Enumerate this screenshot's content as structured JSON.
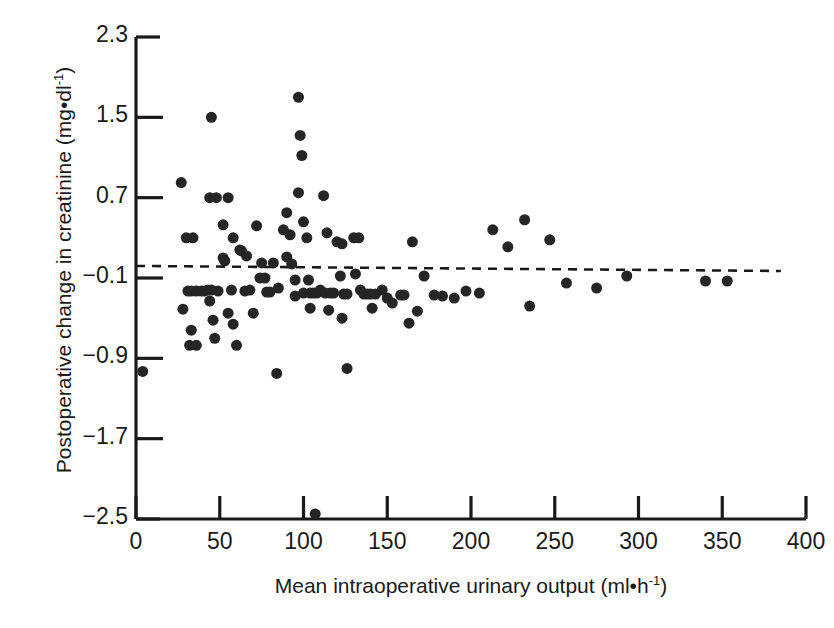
{
  "chart_data": {
    "type": "scatter",
    "title": "",
    "xlabel": "Mean intraoperative urinary output (ml•h⁻¹)",
    "xlabel_main": "Mean intraoperative urinary output (ml•h",
    "xlabel_sup": "-1",
    "xlabel_tail": ")",
    "ylabel": "Postoperative change in creatinine (mg•dl⁻¹)",
    "ylabel_main": "Postoperative change in creatinine (mg•dl",
    "ylabel_sup": "-1",
    "ylabel_tail": ")",
    "xlim": [
      0,
      400
    ],
    "ylim": [
      -2.5,
      2.3
    ],
    "xticks": [
      0,
      50,
      100,
      150,
      200,
      250,
      300,
      350,
      400
    ],
    "xtick_labels": [
      "0",
      "50",
      "100",
      "150",
      "200",
      "250",
      "300",
      "350",
      "400"
    ],
    "yticks": [
      2.3,
      1.5,
      0.7,
      -0.1,
      -0.9,
      -1.7,
      -2.5
    ],
    "ytick_labels": [
      "2.3",
      "1.5",
      "0.7",
      "−0.1",
      "−0.9",
      "−1.7",
      "−2.5"
    ],
    "grid": false,
    "legend": null,
    "marker": "filled-circle",
    "marker_color": "#252525",
    "marker_size_px": 11,
    "axis_color": "#1a1a1a",
    "regression_line": {
      "style": "dashed",
      "color": "#1a1a1a",
      "x_start": 0,
      "x_end": 385,
      "y_start": 0.02,
      "y_end": -0.03
    },
    "points": [
      [
        4,
        -1.03
      ],
      [
        27,
        0.85
      ],
      [
        30,
        0.3
      ],
      [
        34,
        0.3
      ],
      [
        31,
        -0.23
      ],
      [
        33,
        -0.23
      ],
      [
        36,
        -0.23
      ],
      [
        39,
        -0.23
      ],
      [
        41,
        -0.23
      ],
      [
        28,
        -0.41
      ],
      [
        33,
        -0.62
      ],
      [
        32,
        -0.77
      ],
      [
        36,
        -0.77
      ],
      [
        45,
        1.5
      ],
      [
        44,
        0.7
      ],
      [
        48,
        0.7
      ],
      [
        43,
        -0.22
      ],
      [
        45,
        -0.22
      ],
      [
        44,
        -0.33
      ],
      [
        46,
        -0.52
      ],
      [
        47,
        -0.7
      ],
      [
        49,
        -0.23
      ],
      [
        52,
        0.43
      ],
      [
        52,
        0.1
      ],
      [
        53,
        0.07
      ],
      [
        55,
        0.7
      ],
      [
        58,
        0.3
      ],
      [
        57,
        -0.22
      ],
      [
        55,
        -0.45
      ],
      [
        58,
        -0.56
      ],
      [
        60,
        -0.77
      ],
      [
        62,
        0.18
      ],
      [
        63,
        0.17
      ],
      [
        66,
        0.12
      ],
      [
        68,
        -0.22
      ],
      [
        65,
        -0.23
      ],
      [
        70,
        -0.45
      ],
      [
        72,
        0.42
      ],
      [
        75,
        0.05
      ],
      [
        74,
        -0.1
      ],
      [
        77,
        -0.1
      ],
      [
        78,
        -0.24
      ],
      [
        80,
        -0.24
      ],
      [
        82,
        0.05
      ],
      [
        85,
        -0.2
      ],
      [
        84,
        -1.05
      ],
      [
        88,
        0.38
      ],
      [
        90,
        0.55
      ],
      [
        92,
        0.33
      ],
      [
        90,
        0.11
      ],
      [
        93,
        0.04
      ],
      [
        95,
        -0.12
      ],
      [
        95,
        -0.28
      ],
      [
        97,
        1.7
      ],
      [
        98,
        1.32
      ],
      [
        99,
        1.12
      ],
      [
        97,
        0.75
      ],
      [
        100,
        0.46
      ],
      [
        102,
        0.3
      ],
      [
        103,
        -0.12
      ],
      [
        100,
        -0.25
      ],
      [
        104,
        -0.25
      ],
      [
        106,
        -0.25
      ],
      [
        108,
        -0.25
      ],
      [
        104,
        -0.4
      ],
      [
        107,
        -2.45
      ],
      [
        112,
        0.72
      ],
      [
        114,
        0.35
      ],
      [
        110,
        -0.22
      ],
      [
        113,
        -0.25
      ],
      [
        116,
        -0.25
      ],
      [
        118,
        -0.25
      ],
      [
        115,
        -0.42
      ],
      [
        120,
        0.26
      ],
      [
        123,
        0.24
      ],
      [
        122,
        -0.08
      ],
      [
        124,
        -0.26
      ],
      [
        126,
        -0.26
      ],
      [
        123,
        -0.5
      ],
      [
        126,
        -1.0
      ],
      [
        130,
        0.3
      ],
      [
        133,
        0.3
      ],
      [
        131,
        -0.06
      ],
      [
        134,
        -0.22
      ],
      [
        136,
        -0.26
      ],
      [
        138,
        -0.26
      ],
      [
        140,
        -0.26
      ],
      [
        143,
        -0.26
      ],
      [
        141,
        -0.4
      ],
      [
        147,
        -0.22
      ],
      [
        150,
        -0.3
      ],
      [
        153,
        -0.35
      ],
      [
        158,
        -0.27
      ],
      [
        160,
        -0.27
      ],
      [
        163,
        -0.55
      ],
      [
        165,
        0.26
      ],
      [
        168,
        -0.43
      ],
      [
        172,
        -0.08
      ],
      [
        178,
        -0.27
      ],
      [
        183,
        -0.28
      ],
      [
        190,
        -0.3
      ],
      [
        197,
        -0.23
      ],
      [
        205,
        -0.25
      ],
      [
        213,
        0.38
      ],
      [
        222,
        0.21
      ],
      [
        232,
        0.48
      ],
      [
        235,
        -0.38
      ],
      [
        247,
        0.28
      ],
      [
        257,
        -0.15
      ],
      [
        275,
        -0.2
      ],
      [
        293,
        -0.08
      ],
      [
        340,
        -0.13
      ],
      [
        353,
        -0.13
      ]
    ]
  }
}
